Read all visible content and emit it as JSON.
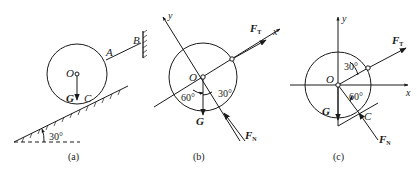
{
  "figures": [
    {
      "caption": "(a)",
      "labels": {
        "center": "O",
        "weight": "G",
        "contact": "C",
        "rope_a": "A",
        "rope_b": "B",
        "angle": "30°"
      }
    },
    {
      "caption": "(b)",
      "labels": {
        "center": "O",
        "weight": "G",
        "tension": "F",
        "tension_sub": "T",
        "normal": "F",
        "normal_sub": "N",
        "axis_x": "x",
        "axis_y": "y",
        "angle_60": "60°",
        "angle_30": "30°"
      }
    },
    {
      "caption": "(c)",
      "labels": {
        "center": "O",
        "weight": "G",
        "contact": "C",
        "tension": "F",
        "tension_sub": "T",
        "normal": "F",
        "normal_sub": "N",
        "axis_x": "x",
        "axis_y": "y",
        "angle_30": "30°",
        "angle_60": "60°"
      }
    }
  ],
  "colors": {
    "ink": "#1a1a1a",
    "background": "#ffffff"
  }
}
